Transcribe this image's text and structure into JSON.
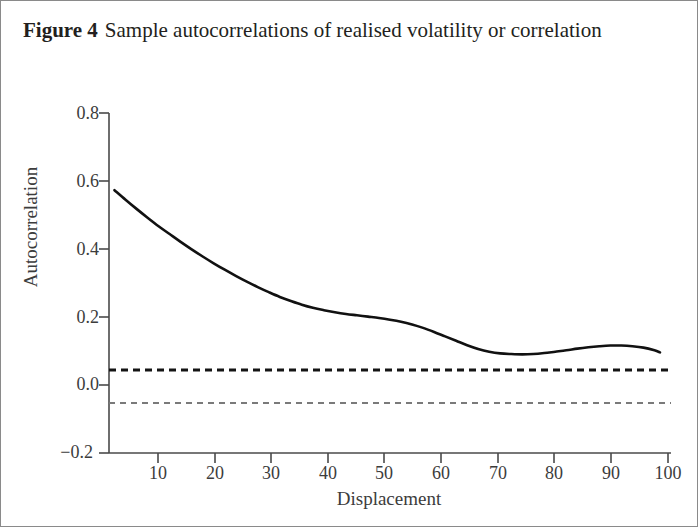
{
  "figure": {
    "label": "Figure 4",
    "caption": "Sample autocorrelations of realised volatility or correlation"
  },
  "chart_data": {
    "type": "line",
    "title": "Sample autocorrelations of realised volatility or correlation",
    "xlabel": "Displacement",
    "ylabel": "Autocorrelation",
    "xlim": [
      0,
      102
    ],
    "ylim": [
      -0.2,
      0.8
    ],
    "xticks": [
      10,
      20,
      30,
      40,
      50,
      60,
      70,
      80,
      90,
      100
    ],
    "xtick_labels": [
      "10",
      "20",
      "30",
      "40",
      "50",
      "60",
      "70",
      "80",
      "90",
      "100"
    ],
    "yticks": [
      -0.2,
      0.0,
      0.2,
      0.4,
      0.6,
      0.8
    ],
    "ytick_labels": [
      "−0.2",
      "0.0",
      "0.2",
      "0.4",
      "0.6",
      "0.8"
    ],
    "grid": false,
    "legend": "none",
    "series": [
      {
        "name": "Sample autocorrelation",
        "style": "solid",
        "color": "#111111",
        "width": 2.6,
        "x": [
          1,
          3,
          5,
          7,
          9,
          11,
          13,
          15,
          17,
          19,
          21,
          23,
          25,
          27,
          29,
          31,
          33,
          35,
          37,
          39,
          41,
          43,
          45,
          47,
          49,
          51,
          53,
          55,
          57,
          59,
          61,
          63,
          65,
          67,
          69,
          71,
          73,
          75,
          77,
          79,
          81,
          83,
          85,
          87,
          89,
          91,
          93,
          95,
          97,
          99,
          100
        ],
        "y": [
          0.573,
          0.545,
          0.518,
          0.492,
          0.467,
          0.444,
          0.421,
          0.399,
          0.378,
          0.358,
          0.339,
          0.321,
          0.304,
          0.288,
          0.273,
          0.259,
          0.247,
          0.236,
          0.227,
          0.22,
          0.214,
          0.209,
          0.205,
          0.201,
          0.197,
          0.192,
          0.186,
          0.178,
          0.168,
          0.156,
          0.143,
          0.13,
          0.117,
          0.106,
          0.098,
          0.093,
          0.091,
          0.09,
          0.091,
          0.094,
          0.098,
          0.102,
          0.107,
          0.111,
          0.114,
          0.116,
          0.116,
          0.114,
          0.11,
          0.102,
          0.096
        ]
      },
      {
        "name": "Upper confidence band",
        "style": "dashed",
        "color": "#141414",
        "width": 3.0,
        "value": 0.044
      },
      {
        "name": "Lower confidence band",
        "style": "dashed",
        "color": "#7a7a7a",
        "width": 2.0,
        "value": -0.053
      }
    ]
  }
}
